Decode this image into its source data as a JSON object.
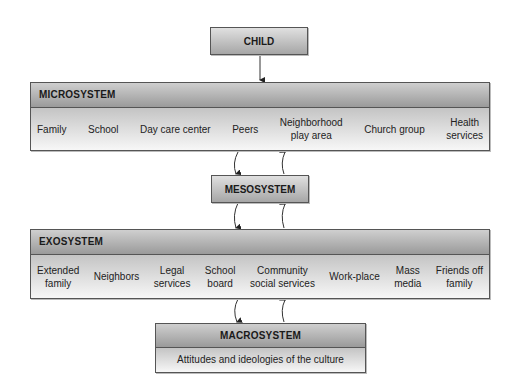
{
  "child": {
    "label": "CHILD"
  },
  "microsystem": {
    "title": "MICROSYSTEM",
    "items": [
      "Family",
      "School",
      "Day care center",
      "Peers",
      "Neighborhood\nplay area",
      "Church group",
      "Health\nservices"
    ]
  },
  "mesosystem": {
    "label": "MESOSYSTEM"
  },
  "exosystem": {
    "title": "EXOSYSTEM",
    "items": [
      "Extended\nfamily",
      "Neighbors",
      "Legal\nservices",
      "School\nboard",
      "Community\nsocial services",
      "Work-place",
      "Mass\nmedia",
      "Friends off\nfamily"
    ]
  },
  "macrosystem": {
    "title": "MACROSYSTEM",
    "description": "Attitudes and ideologies of the culture"
  }
}
